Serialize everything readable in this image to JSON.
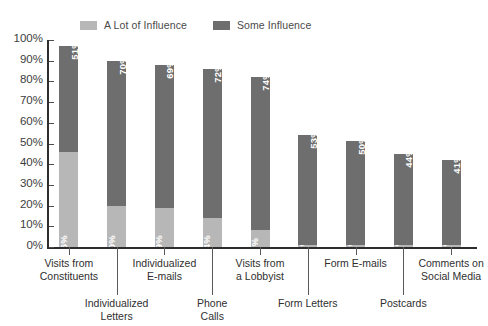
{
  "legend": {
    "entries": [
      {
        "label": "A Lot of Influence",
        "color": "#b7b7b7",
        "icon": "legend-swatch-icon"
      },
      {
        "label": "Some Influence",
        "color": "#6e6e6e",
        "icon": "legend-swatch-icon"
      }
    ]
  },
  "chart_data": {
    "type": "bar",
    "title": "",
    "subtitle": "",
    "xlabel": "",
    "ylabel": "",
    "stacked": true,
    "grid": false,
    "legend_position": "top",
    "ylim": [
      0,
      100
    ],
    "yticks": [
      "0%",
      "10%",
      "20%",
      "30%",
      "40%",
      "50%",
      "60%",
      "70%",
      "80%",
      "90%",
      "100%"
    ],
    "ytick_values": [
      0,
      10,
      20,
      30,
      40,
      50,
      60,
      70,
      80,
      90,
      100
    ],
    "categories": [
      "Visits from\nConstituents",
      "Individualized\nLetters",
      "Individualized\nE-mails",
      "Phone\nCalls",
      "Visits from\na Lobbyist",
      "Form Letters",
      "Form E-mails",
      "Postcards",
      "Comments on\nSocial Media"
    ],
    "series": [
      {
        "name": "A Lot of Influence",
        "color": "#b7b7b7",
        "values": [
          46,
          20,
          19,
          14,
          8,
          1,
          1,
          1,
          1
        ],
        "labels": [
          "46%",
          "20%",
          "19%",
          "14%",
          "8%",
          "1%",
          "1%",
          "1%",
          "1%"
        ]
      },
      {
        "name": "Some Influence",
        "color": "#6e6e6e",
        "values": [
          51,
          70,
          69,
          72,
          74,
          53,
          50,
          44,
          41
        ],
        "labels": [
          "51%",
          "70%",
          "69%",
          "72%",
          "74%",
          "53%",
          "50%",
          "44%",
          "41%"
        ]
      }
    ],
    "totals": [
      97,
      90,
      88,
      86,
      82,
      54,
      51,
      45,
      42
    ]
  },
  "style": {
    "axis_color": "#2d2d2d",
    "background": "#ffffff",
    "text_color": "#3a3a3a"
  }
}
